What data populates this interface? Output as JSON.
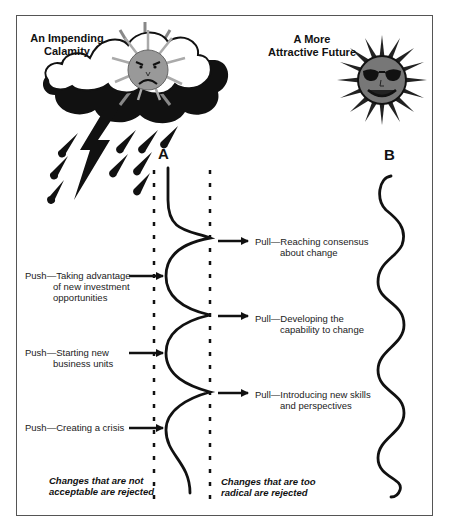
{
  "diagram": {
    "left_title": {
      "line1": "An Impending",
      "line2": "Calamity"
    },
    "right_title": {
      "line1": "A More",
      "line2": "Attractive Future"
    },
    "path_a_label": "A",
    "path_b_label": "B",
    "push_forces": [
      {
        "lead": "Push—Taking advantage",
        "cont1": "of new investment",
        "cont2": "opportunities"
      },
      {
        "lead": "Push—Starting new",
        "cont1": "business units"
      },
      {
        "lead": "Push—Creating a crisis"
      }
    ],
    "pull_forces": [
      {
        "lead": "Pull—Reaching consensus",
        "cont1": "about change"
      },
      {
        "lead": "Pull—Developing the",
        "cont1": "capability to change"
      },
      {
        "lead": "Pull—Introducing new skills",
        "cont1": "and perspectives"
      }
    ],
    "left_boundary_note": {
      "line1": "Changes that are not",
      "line2": "acceptable are rejected"
    },
    "right_boundary_note": {
      "line1": "Changes that are too",
      "line2": "radical are rejected"
    },
    "icons": {
      "storm": "angry-sun-behind-storm-cloud-with-rain-and-lightning",
      "sun": "smiling-sun-with-sunglasses"
    }
  }
}
